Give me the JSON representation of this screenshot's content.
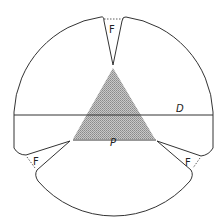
{
  "diagram": {
    "labels": {
      "flap_top": "F",
      "flap_left": "F",
      "flap_right": "F",
      "diameter": "D",
      "triangle_base": "P"
    },
    "colors": {
      "stroke": "#333333",
      "shade": "#b0b0b0",
      "background": "#ffffff"
    }
  }
}
